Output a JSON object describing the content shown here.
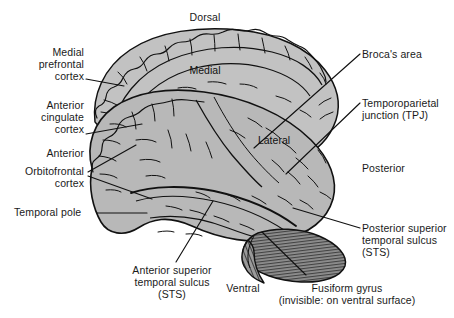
{
  "figure": {
    "background_color": "#ffffff",
    "cortex_fill": "#b8b8b8",
    "cortex_fill_light": "#c6c6c6",
    "cerebellum_fill": "#8a8a8a",
    "outline_color": "#111111",
    "text_color": "#1a1a1a"
  },
  "orientation_labels": {
    "dorsal": "Dorsal",
    "ventral": "Ventral",
    "anterior": "Anterior",
    "posterior": "Posterior"
  },
  "surface_labels": {
    "medial": "Medial",
    "lateral": "Lateral"
  },
  "left_labels": [
    {
      "id": "medial-prefrontal-cortex",
      "lines": [
        "Medial",
        "prefrontal",
        "cortex"
      ]
    },
    {
      "id": "anterior-cingulate-cortex",
      "lines": [
        "Anterior",
        "cingulate",
        "cortex"
      ]
    },
    {
      "id": "orbitofrontal-cortex",
      "lines": [
        "Orbitofrontal",
        "cortex"
      ]
    },
    {
      "id": "temporal-pole",
      "lines": [
        "Temporal pole"
      ]
    }
  ],
  "right_labels": [
    {
      "id": "brocas-area",
      "lines": [
        "Broca's area"
      ]
    },
    {
      "id": "temporoparietal-junction",
      "lines": [
        "Temporoparietal",
        "junction (TPJ)"
      ]
    },
    {
      "id": "posterior-superior-temporal-sulcus",
      "lines": [
        "Posterior superior",
        "temporal sulcus",
        "(STS)"
      ]
    }
  ],
  "bottom_labels": [
    {
      "id": "anterior-superior-temporal-sulcus",
      "lines": [
        "Anterior superior",
        "temporal sulcus",
        "(STS)"
      ]
    },
    {
      "id": "fusiform-gyrus",
      "lines": [
        "Fusiform gyrus",
        "(invisible: on ventral surface)"
      ]
    }
  ],
  "label_text": {
    "medial_prefrontal_1": "Medial",
    "medial_prefrontal_2": "prefrontal",
    "medial_prefrontal_3": "cortex",
    "anterior_cingulate_1": "Anterior",
    "anterior_cingulate_2": "cingulate",
    "anterior_cingulate_3": "cortex",
    "orbitofrontal_1": "Orbitofrontal",
    "orbitofrontal_2": "cortex",
    "temporal_pole_1": "Temporal pole",
    "brocas_1": "Broca's area",
    "tpj_1": "Temporoparietal",
    "tpj_2": "junction (TPJ)",
    "post_sts_1": "Posterior superior",
    "post_sts_2": "temporal sulcus",
    "post_sts_3": "(STS)",
    "ant_sts_1": "Anterior superior",
    "ant_sts_2": "temporal sulcus",
    "ant_sts_3": "(STS)",
    "fusiform_1": "Fusiform gyrus",
    "fusiform_2": "(invisible: on ventral surface)"
  }
}
